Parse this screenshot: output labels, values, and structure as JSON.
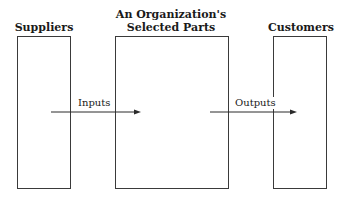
{
  "diagram": {
    "type": "flow",
    "nodes": [
      {
        "id": "suppliers",
        "title": "Suppliers"
      },
      {
        "id": "organization",
        "title_line1": "An Organization's",
        "title_line2": "Selected Parts"
      },
      {
        "id": "customers",
        "title": "Customers"
      }
    ],
    "edges": [
      {
        "from": "suppliers",
        "to": "organization",
        "label": "Inputs"
      },
      {
        "from": "organization",
        "to": "customers",
        "label": "Outputs"
      }
    ],
    "colors": {
      "stroke": "#3a3a3a",
      "text": "#1a1a1a",
      "background": "#ffffff"
    }
  }
}
